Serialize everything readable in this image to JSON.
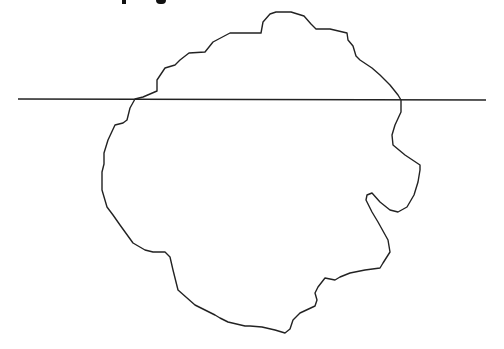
{
  "title": {
    "text": "",
    "note": "clipped at top edge; only descender fragments visible"
  },
  "diagram": {
    "stroke_color": "#222222",
    "background": "#ffffff",
    "shape": {
      "label": "irregular closed outline",
      "points": [
        [
          261,
          33
        ],
        [
          263,
          22
        ],
        [
          270,
          14
        ],
        [
          276,
          12
        ],
        [
          291,
          12
        ],
        [
          304,
          16
        ],
        [
          311,
          24
        ],
        [
          316,
          29
        ],
        [
          330,
          29
        ],
        [
          347,
          33
        ],
        [
          348,
          40
        ],
        [
          353,
          46
        ],
        [
          356,
          56
        ],
        [
          360,
          60
        ],
        [
          372,
          68
        ],
        [
          380,
          75
        ],
        [
          390,
          85
        ],
        [
          398,
          95
        ],
        [
          401,
          100
        ],
        [
          401,
          112
        ],
        [
          395,
          125
        ],
        [
          392,
          135
        ],
        [
          393,
          145
        ],
        [
          405,
          155
        ],
        [
          420,
          165
        ],
        [
          420,
          170
        ],
        [
          418,
          182
        ],
        [
          414,
          195
        ],
        [
          407,
          207
        ],
        [
          398,
          212
        ],
        [
          390,
          210
        ],
        [
          380,
          202
        ],
        [
          372,
          193
        ],
        [
          367,
          195
        ],
        [
          366,
          200
        ],
        [
          372,
          212
        ],
        [
          378,
          222
        ],
        [
          388,
          240
        ],
        [
          390,
          252
        ],
        [
          383,
          263
        ],
        [
          380,
          268
        ],
        [
          365,
          270
        ],
        [
          350,
          273
        ],
        [
          340,
          277
        ],
        [
          335,
          280
        ],
        [
          325,
          278
        ],
        [
          318,
          287
        ],
        [
          315,
          293
        ],
        [
          317,
          300
        ],
        [
          315,
          306
        ],
        [
          300,
          313
        ],
        [
          293,
          320
        ],
        [
          290,
          329
        ],
        [
          285,
          333
        ],
        [
          275,
          330
        ],
        [
          262,
          327
        ],
        [
          250,
          326
        ],
        [
          245,
          326
        ],
        [
          228,
          322
        ],
        [
          220,
          318
        ],
        [
          215,
          315
        ],
        [
          195,
          305
        ],
        [
          178,
          290
        ],
        [
          173,
          270
        ],
        [
          170,
          257
        ],
        [
          165,
          252
        ],
        [
          153,
          252
        ],
        [
          145,
          250
        ],
        [
          133,
          243
        ],
        [
          120,
          225
        ],
        [
          113,
          215
        ],
        [
          107,
          207
        ],
        [
          102,
          190
        ],
        [
          102,
          172
        ],
        [
          104,
          164
        ],
        [
          104,
          153
        ],
        [
          108,
          140
        ],
        [
          115,
          125
        ],
        [
          123,
          123
        ],
        [
          127,
          120
        ],
        [
          130,
          108
        ],
        [
          135,
          99
        ],
        [
          143,
          97
        ],
        [
          157,
          91
        ],
        [
          157,
          80
        ],
        [
          165,
          68
        ],
        [
          175,
          65
        ],
        [
          180,
          60
        ],
        [
          189,
          53
        ],
        [
          205,
          52
        ],
        [
          213,
          42
        ],
        [
          230,
          33
        ],
        [
          250,
          33
        ]
      ]
    },
    "line": {
      "label": "horizontal line",
      "x1": 18,
      "y1": 99,
      "x2": 486,
      "y2": 100
    }
  }
}
